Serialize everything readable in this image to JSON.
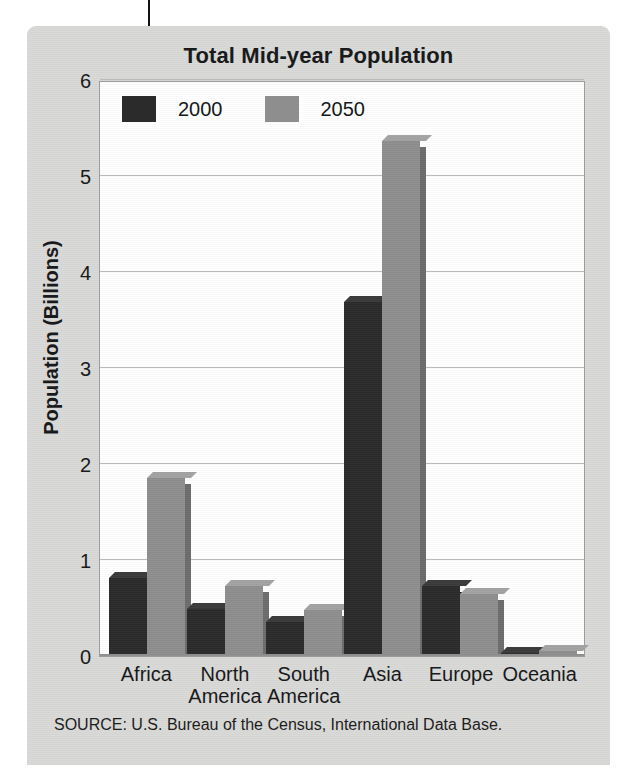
{
  "figure": {
    "title": "Total Mid-year Population",
    "source": "SOURCE: U.S. Bureau of the Census, International Data Base."
  },
  "colors": {
    "panel_background": "#d9d9d7",
    "plot_background": "#ffffff",
    "series_2000": "#2b2b2b",
    "series_2050": "#8e8e8e",
    "gridline": "#b9b9b9",
    "text": "#16181a"
  },
  "chart_data": {
    "type": "bar",
    "title": "Total Mid-year Population",
    "xlabel": "",
    "ylabel": "Population (Billions)",
    "ylim": [
      0,
      6
    ],
    "yticks": [
      0,
      1,
      2,
      3,
      4,
      5,
      6
    ],
    "ytick_labels": [
      "0",
      "1",
      "2",
      "3",
      "4",
      "5",
      "6"
    ],
    "grid": true,
    "legend_position": "top-left inside plot",
    "categories": [
      "Africa",
      "North America",
      "South America",
      "Asia",
      "Europe",
      "Oceania"
    ],
    "category_lines": [
      [
        "Africa"
      ],
      [
        "North",
        "America"
      ],
      [
        "South",
        "America"
      ],
      [
        "Asia"
      ],
      [
        "Europe"
      ],
      [
        "Oceania"
      ]
    ],
    "series": [
      {
        "name": "2000",
        "color": "#2b2b2b",
        "values": [
          0.81,
          0.49,
          0.35,
          3.69,
          0.73,
          0.03
        ]
      },
      {
        "name": "2050",
        "color": "#8e8e8e",
        "values": [
          1.85,
          0.73,
          0.48,
          5.36,
          0.65,
          0.05
        ]
      }
    ]
  }
}
